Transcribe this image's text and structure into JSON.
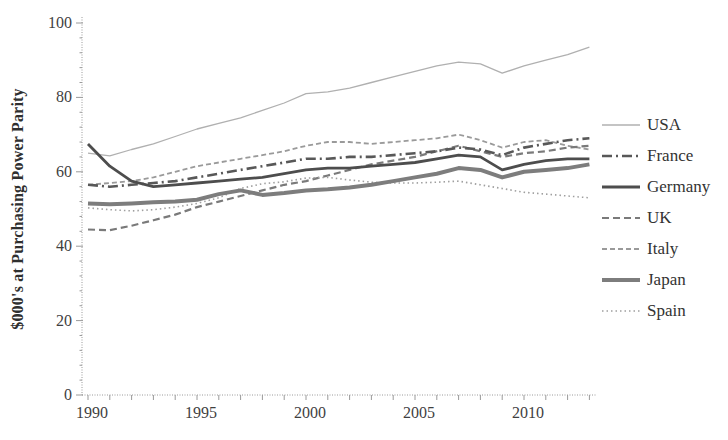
{
  "chart_data": {
    "type": "line",
    "title": "",
    "ylabel": "$000's at Purchasing Power Parity",
    "xlabel": "",
    "x": [
      1990,
      1991,
      1992,
      1993,
      1994,
      1995,
      1996,
      1997,
      1998,
      1999,
      2000,
      2001,
      2002,
      2003,
      2004,
      2005,
      2006,
      2007,
      2008,
      2009,
      2010,
      2011,
      2012,
      2013
    ],
    "x_tick_years": [
      1990,
      1995,
      2000,
      2005,
      2010
    ],
    "yticks": [
      0,
      20,
      40,
      60,
      80,
      100
    ],
    "ylim": [
      0,
      100
    ],
    "grid": false,
    "legend_position": "right",
    "axis_color": "#9a9a9a",
    "tick_label_color": "#3f3f3f",
    "series": [
      {
        "name": "USA",
        "color": "#b0b0b0",
        "width": 1.3,
        "dash": "",
        "line_style": "solid",
        "values": [
          65,
          64.3,
          66,
          67.5,
          69.5,
          71.5,
          73,
          74.5,
          76.5,
          78.5,
          81,
          81.5,
          82.5,
          84,
          85.5,
          87,
          88.5,
          89.5,
          89,
          86.5,
          88.5,
          90,
          91.5,
          93.5
        ]
      },
      {
        "name": "France",
        "color": "#585858",
        "width": 2.6,
        "dash": "10 4 2 4",
        "line_style": "dash-dot",
        "values": [
          56.5,
          56,
          56.5,
          57,
          57.5,
          58.5,
          59.5,
          60.5,
          61.5,
          62.5,
          63.5,
          63.5,
          64,
          64,
          64.5,
          65,
          65.5,
          66.5,
          66,
          64.5,
          66.5,
          67.5,
          68.5,
          69
        ]
      },
      {
        "name": "Germany",
        "color": "#4d4d4d",
        "width": 2.8,
        "dash": "",
        "line_style": "solid",
        "values": [
          67.5,
          61.5,
          57.5,
          56,
          56.5,
          57,
          57.5,
          58,
          58.5,
          59.5,
          60.5,
          61,
          61,
          61.5,
          62,
          62.5,
          63.5,
          64.5,
          64,
          60.5,
          62,
          63,
          63.5,
          63.5
        ]
      },
      {
        "name": "UK",
        "color": "#7a7a7a",
        "width": 2.2,
        "dash": "7 4",
        "line_style": "dashed",
        "values": [
          44.5,
          44.3,
          45.5,
          47,
          48.5,
          50.5,
          52,
          53.5,
          55,
          56.5,
          57.5,
          59,
          60.5,
          62,
          63,
          64,
          65.5,
          67,
          65.5,
          64,
          65,
          65.5,
          66.5,
          67
        ]
      },
      {
        "name": "Italy",
        "color": "#9a9a9a",
        "width": 1.8,
        "dash": "5 3",
        "line_style": "dashed",
        "values": [
          56.5,
          57,
          57.5,
          58.5,
          60,
          61.5,
          62.5,
          63.5,
          64.5,
          65.5,
          67,
          68,
          68,
          67.5,
          68,
          68.5,
          69,
          70,
          68.5,
          66.5,
          68,
          68.5,
          67,
          66
        ]
      },
      {
        "name": "Japan",
        "color": "#7d7d7d",
        "width": 4,
        "dash": "",
        "line_style": "solid",
        "values": [
          51.5,
          51.3,
          51.5,
          51.8,
          52,
          52.5,
          54,
          55,
          53.8,
          54.3,
          55,
          55.3,
          55.8,
          56.5,
          57.5,
          58.5,
          59.5,
          61,
          60.5,
          58.5,
          60,
          60.5,
          61,
          62
        ]
      },
      {
        "name": "Spain",
        "color": "#9f9f9f",
        "width": 1.6,
        "dash": "1.5 3",
        "line_style": "dotted",
        "values": [
          50.3,
          49.8,
          49.5,
          49.8,
          50.5,
          51.5,
          53,
          55.5,
          56.8,
          57.3,
          58.3,
          58.5,
          57.8,
          57.2,
          57,
          57,
          57.2,
          57.5,
          56.5,
          55.5,
          54.5,
          54,
          53.5,
          53
        ]
      }
    ]
  }
}
